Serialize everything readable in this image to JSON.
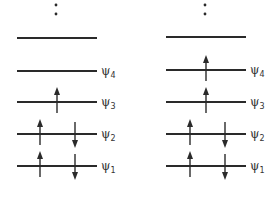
{
  "diagram": {
    "type": "molecular-orbital-occupancy",
    "colors": {
      "ink": "#2a2a2a",
      "background": "#ffffff"
    },
    "continuation_marker": "⋮",
    "levels": [
      {
        "label": "ψ",
        "subscript": "",
        "y": 38
      },
      {
        "label": "ψ",
        "subscript": "4",
        "y": 71
      },
      {
        "label": "ψ",
        "subscript": "3",
        "y": 102
      },
      {
        "label": "ψ",
        "subscript": "2",
        "y": 134
      },
      {
        "label": "ψ",
        "subscript": "1",
        "y": 166
      }
    ],
    "panels": [
      {
        "name": "left-configuration",
        "occupancy": {
          "psi1": "up+down",
          "psi2": "up+down",
          "psi3": "up",
          "psi4": "empty",
          "top": "empty"
        }
      },
      {
        "name": "right-configuration",
        "occupancy": {
          "psi1": "up+down",
          "psi2": "up+down",
          "psi3": "up",
          "psi4": "up",
          "top": "empty"
        }
      }
    ]
  }
}
